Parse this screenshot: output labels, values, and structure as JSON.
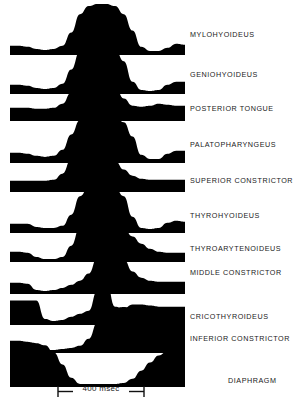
{
  "figure": {
    "type": "emg-trace-panel",
    "ink_color": "#000000",
    "background_color": "#ffffff",
    "scalebar": {
      "label": "400 msec",
      "duration_ms": 400,
      "x_start_px": 57,
      "x_end_px": 145
    }
  },
  "chart_data": {
    "type": "area",
    "title": "",
    "subtitle": "",
    "xlabel": "400 msec",
    "ylabel": "",
    "grid": false,
    "legend_position": "right",
    "x": [
      0,
      5,
      10,
      15,
      20,
      25,
      30,
      35,
      40,
      45,
      50,
      55,
      60,
      65,
      70,
      75,
      80,
      85,
      90,
      95,
      100
    ],
    "x_units": "percent of trace width",
    "scalebar_ms": 400,
    "series": [
      {
        "name": "MYLOHYOIDEUS",
        "values": [
          9,
          9,
          8,
          6,
          5,
          6,
          9,
          22,
          40,
          48,
          50,
          50,
          48,
          40,
          24,
          8,
          4,
          4,
          7,
          11,
          10
        ]
      },
      {
        "name": "GENIOHYOIDEUS",
        "values": [
          9,
          9,
          8,
          6,
          5,
          6,
          10,
          24,
          42,
          48,
          49,
          48,
          44,
          32,
          12,
          4,
          3,
          4,
          9,
          12,
          12
        ]
      },
      {
        "name": "POSTERIOR TONGUE",
        "values": [
          13,
          13,
          13,
          12,
          12,
          13,
          17,
          28,
          38,
          42,
          42,
          40,
          34,
          22,
          15,
          14,
          15,
          17,
          16,
          15,
          15
        ]
      },
      {
        "name": "PALATOPHARYNGEUS",
        "values": [
          10,
          10,
          9,
          7,
          6,
          7,
          13,
          28,
          42,
          47,
          48,
          47,
          45,
          40,
          26,
          8,
          4,
          4,
          9,
          12,
          12
        ]
      },
      {
        "name": "SUPERIOR CONSTRICTOR",
        "values": [
          11,
          11,
          11,
          11,
          11,
          12,
          18,
          32,
          40,
          41,
          40,
          37,
          31,
          22,
          16,
          13,
          12,
          12,
          12,
          12,
          12
        ]
      },
      {
        "name": "THYROHYOIDEUS",
        "values": [
          9,
          9,
          9,
          6,
          5,
          5,
          7,
          18,
          36,
          45,
          47,
          46,
          44,
          36,
          16,
          5,
          4,
          5,
          10,
          12,
          11
        ]
      },
      {
        "name": "THYROARYTENOIDEUS",
        "values": [
          10,
          10,
          9,
          5,
          3,
          3,
          5,
          16,
          34,
          43,
          45,
          44,
          40,
          33,
          25,
          18,
          13,
          10,
          9,
          9,
          9
        ]
      },
      {
        "name": "MIDDLE CONSTRICTOR",
        "values": [
          11,
          11,
          10,
          4,
          3,
          4,
          6,
          9,
          13,
          20,
          36,
          46,
          44,
          34,
          22,
          16,
          13,
          12,
          12,
          12,
          12
        ]
      },
      {
        "name": "CRICOTHYROIDEUS",
        "values": [
          24,
          24,
          24,
          24,
          6,
          4,
          5,
          8,
          11,
          14,
          34,
          44,
          18,
          16,
          20,
          20,
          19,
          18,
          18,
          18,
          18
        ]
      },
      {
        "name": "INFERIOR CONSTRICTOR",
        "values": [
          12,
          12,
          11,
          5,
          3,
          3,
          4,
          5,
          7,
          14,
          30,
          40,
          44,
          45,
          44,
          42,
          40,
          38,
          36,
          34,
          33
        ]
      },
      {
        "name": "DIAPHRAGM",
        "values": [
          44,
          44,
          44,
          43,
          41,
          34,
          22,
          9,
          3,
          3,
          3,
          3,
          3,
          4,
          8,
          16,
          24,
          31,
          35,
          37,
          38
        ]
      }
    ]
  },
  "traces": [
    {
      "label": "MYLOHYOIDEUS",
      "label_x": 190,
      "label_y": 30,
      "row_y": 2
    },
    {
      "label": "GENIOHYOIDEUS",
      "label_x": 190,
      "label_y": 70,
      "row_y": 42
    },
    {
      "label": "POSTERIOR TONGUE",
      "label_x": 190,
      "label_y": 104,
      "row_y": 76
    },
    {
      "label": "PALATOPHARYNGEUS",
      "label_x": 190,
      "label_y": 140,
      "row_y": 112
    },
    {
      "label": "SUPERIOR CONSTRICTOR",
      "label_x": 190,
      "label_y": 176,
      "row_y": 148
    },
    {
      "label": "THYROHYOIDEUS",
      "label_x": 190,
      "label_y": 211,
      "row_y": 183
    },
    {
      "label": "THYROARYTENOIDEUS",
      "label_x": 190,
      "label_y": 244,
      "row_y": 214
    },
    {
      "label": "MIDDLE CONSTRICTOR",
      "label_x": 190,
      "label_y": 268,
      "row_y": 245
    },
    {
      "label": "CRICOTHYROIDEUS",
      "label_x": 190,
      "label_y": 312,
      "row_y": 278
    },
    {
      "label": "INFERIOR CONSTRICTOR",
      "label_x": 190,
      "label_y": 334,
      "row_y": 305
    },
    {
      "label": "DIAPHRAGM",
      "label_x": 228,
      "label_y": 376,
      "row_y": 340
    }
  ]
}
